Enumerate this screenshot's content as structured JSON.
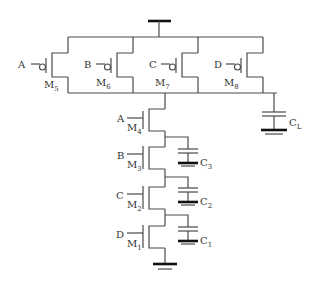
{
  "diagram": {
    "type": "CMOS 4-input NAND gate schematic",
    "supply": {
      "symbol": "vdd-bar"
    },
    "ground": {
      "symbol": "ground"
    },
    "pmos": [
      {
        "name": "M",
        "sub": "5",
        "input": "A"
      },
      {
        "name": "M",
        "sub": "6",
        "input": "B"
      },
      {
        "name": "M",
        "sub": "7",
        "input": "C"
      },
      {
        "name": "M",
        "sub": "8",
        "input": "D"
      }
    ],
    "nmos": [
      {
        "name": "M",
        "sub": "4",
        "input": "A"
      },
      {
        "name": "M",
        "sub": "3",
        "input": "B"
      },
      {
        "name": "M",
        "sub": "2",
        "input": "C"
      },
      {
        "name": "M",
        "sub": "1",
        "input": "D"
      }
    ],
    "capacitors": [
      {
        "name": "C",
        "sub": "L"
      },
      {
        "name": "C",
        "sub": "3"
      },
      {
        "name": "C",
        "sub": "2"
      },
      {
        "name": "C",
        "sub": "1"
      }
    ],
    "colors": {
      "wire": "#4a4a4a",
      "ground_bar": "#111111",
      "text": "#333333"
    }
  }
}
